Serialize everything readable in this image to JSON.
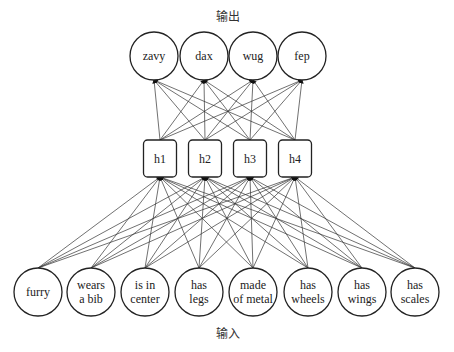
{
  "title_output": "输出",
  "title_input": "输入",
  "outputs": [
    {
      "label": "zavy",
      "x": 154
    },
    {
      "label": "dax",
      "x": 204
    },
    {
      "label": "wug",
      "x": 253
    },
    {
      "label": "fep",
      "x": 302
    }
  ],
  "hidden": [
    {
      "label": "h1",
      "x": 160
    },
    {
      "label": "h2",
      "x": 205
    },
    {
      "label": "h3",
      "x": 250
    },
    {
      "label": "h4",
      "x": 295
    }
  ],
  "inputs": [
    {
      "label": "furry",
      "x": 38
    },
    {
      "label": "wears a bib",
      "x": 91
    },
    {
      "label": "is in center",
      "x": 145
    },
    {
      "label": "has legs",
      "x": 199
    },
    {
      "label": "made of metal",
      "x": 253
    },
    {
      "label": "has wheels",
      "x": 308
    },
    {
      "label": "has wings",
      "x": 362
    },
    {
      "label": "has scales",
      "x": 415
    }
  ]
}
